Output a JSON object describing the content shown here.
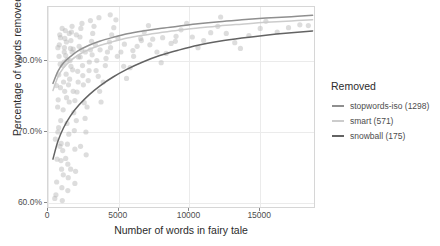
{
  "chart_data": {
    "type": "scatter",
    "title": "",
    "xlabel": "Number of words in fairy tale",
    "ylabel": "Percentage of words removed",
    "xlim": [
      0,
      18800
    ],
    "ylim": [
      0.595,
      0.875
    ],
    "xticks": [
      0,
      5000,
      10000,
      15000
    ],
    "xticklabels": [
      "0",
      "5000",
      "10000",
      "15000"
    ],
    "yticks": [
      0.6,
      0.7,
      0.8
    ],
    "yticklabels": [
      "60.0%",
      "70.0%",
      "80.0%"
    ],
    "grid": true,
    "legend_position": "right",
    "legend_title": "Removed",
    "point_color": "#b3b3b3",
    "point_alpha": 0.45,
    "point_radius": 2.6,
    "series": [
      {
        "name": "stopwords-iso (1298)",
        "label": "stopwords-iso",
        "count": 1298,
        "color": "#8f8f8f",
        "curve": [
          [
            350,
            0.768
          ],
          [
            700,
            0.785
          ],
          [
            1100,
            0.797
          ],
          [
            1600,
            0.806
          ],
          [
            2200,
            0.8145
          ],
          [
            2900,
            0.8215
          ],
          [
            3700,
            0.8275
          ],
          [
            4600,
            0.8325
          ],
          [
            5600,
            0.8375
          ],
          [
            6700,
            0.8415
          ],
          [
            7900,
            0.845
          ],
          [
            9200,
            0.848
          ],
          [
            10600,
            0.8515
          ],
          [
            12100,
            0.8545
          ],
          [
            13700,
            0.857
          ],
          [
            15400,
            0.8595
          ],
          [
            17200,
            0.8615
          ],
          [
            18700,
            0.8635
          ]
        ]
      },
      {
        "name": "smart (571)",
        "label": "smart",
        "count": 571,
        "color": "#cccccc",
        "curve": [
          [
            350,
            0.758
          ],
          [
            700,
            0.777
          ],
          [
            1100,
            0.79
          ],
          [
            1600,
            0.8
          ],
          [
            2200,
            0.8085
          ],
          [
            2900,
            0.8155
          ],
          [
            3700,
            0.8215
          ],
          [
            4600,
            0.8265
          ],
          [
            5600,
            0.8315
          ],
          [
            6700,
            0.8355
          ],
          [
            7900,
            0.839
          ],
          [
            9200,
            0.8425
          ],
          [
            10600,
            0.8455
          ],
          [
            12100,
            0.8485
          ],
          [
            13700,
            0.851
          ],
          [
            15400,
            0.8535
          ],
          [
            17200,
            0.8555
          ],
          [
            18700,
            0.857
          ]
        ]
      },
      {
        "name": "snowball (175)",
        "label": "snowball",
        "count": 175,
        "color": "#636363",
        "curve": [
          [
            350,
            0.662
          ],
          [
            700,
            0.687
          ],
          [
            1100,
            0.706
          ],
          [
            1600,
            0.723
          ],
          [
            2200,
            0.738
          ],
          [
            2900,
            0.752
          ],
          [
            3700,
            0.765
          ],
          [
            4600,
            0.777
          ],
          [
            5600,
            0.788
          ],
          [
            6700,
            0.798
          ],
          [
            7900,
            0.807
          ],
          [
            9200,
            0.8145
          ],
          [
            10600,
            0.8215
          ],
          [
            12100,
            0.827
          ],
          [
            13700,
            0.8315
          ],
          [
            15400,
            0.8355
          ],
          [
            17200,
            0.839
          ],
          [
            18700,
            0.8415
          ]
        ]
      }
    ],
    "points": [
      [
        520,
        0.69
      ],
      [
        480,
        0.607
      ],
      [
        560,
        0.612
      ],
      [
        610,
        0.63
      ],
      [
        640,
        0.662
      ],
      [
        700,
        0.7
      ],
      [
        720,
        0.745
      ],
      [
        760,
        0.78
      ],
      [
        780,
        0.806
      ],
      [
        800,
        0.822
      ],
      [
        830,
        0.836
      ],
      [
        860,
        0.795
      ],
      [
        880,
        0.762
      ],
      [
        900,
        0.716
      ],
      [
        930,
        0.684
      ],
      [
        960,
        0.648
      ],
      [
        980,
        0.622
      ],
      [
        1010,
        0.604
      ],
      [
        1040,
        0.674
      ],
      [
        1070,
        0.731
      ],
      [
        1100,
        0.77
      ],
      [
        1130,
        0.798
      ],
      [
        1160,
        0.818
      ],
      [
        1190,
        0.831
      ],
      [
        1220,
        0.842
      ],
      [
        1250,
        0.807
      ],
      [
        1280,
        0.781
      ],
      [
        1310,
        0.748
      ],
      [
        1340,
        0.712
      ],
      [
        1370,
        0.683
      ],
      [
        1400,
        0.655
      ],
      [
        1430,
        0.636
      ],
      [
        1470,
        0.697
      ],
      [
        1500,
        0.742
      ],
      [
        1530,
        0.774
      ],
      [
        1560,
        0.8
      ],
      [
        1590,
        0.817
      ],
      [
        1620,
        0.828
      ],
      [
        1660,
        0.84
      ],
      [
        1700,
        0.812
      ],
      [
        1740,
        0.787
      ],
      [
        1780,
        0.757
      ],
      [
        1820,
        0.727
      ],
      [
        1860,
        0.702
      ],
      [
        1900,
        0.676
      ],
      [
        1950,
        0.645
      ],
      [
        2000,
        0.716
      ],
      [
        2050,
        0.756
      ],
      [
        2100,
        0.785
      ],
      [
        2150,
        0.805
      ],
      [
        2200,
        0.82
      ],
      [
        2260,
        0.833
      ],
      [
        2320,
        0.845
      ],
      [
        2380,
        0.815
      ],
      [
        2440,
        0.793
      ],
      [
        2500,
        0.766
      ],
      [
        2560,
        0.741
      ],
      [
        2620,
        0.719
      ],
      [
        2680,
        0.7
      ],
      [
        2760,
        0.735
      ],
      [
        2840,
        0.772
      ],
      [
        2920,
        0.798
      ],
      [
        3000,
        0.815
      ],
      [
        3080,
        0.827
      ],
      [
        3160,
        0.838
      ],
      [
        3250,
        0.848
      ],
      [
        3350,
        0.822
      ],
      [
        3450,
        0.8
      ],
      [
        3550,
        0.778
      ],
      [
        3650,
        0.757
      ],
      [
        3750,
        0.742
      ],
      [
        3900,
        0.77
      ],
      [
        4050,
        0.793
      ],
      [
        4200,
        0.812
      ],
      [
        4350,
        0.826
      ],
      [
        4500,
        0.836
      ],
      [
        4650,
        0.846
      ],
      [
        4800,
        0.857
      ],
      [
        4950,
        0.831
      ],
      [
        5150,
        0.812
      ],
      [
        5350,
        0.792
      ],
      [
        5550,
        0.775
      ],
      [
        5800,
        0.79
      ],
      [
        6050,
        0.806
      ],
      [
        6300,
        0.82
      ],
      [
        6550,
        0.831
      ],
      [
        6800,
        0.84
      ],
      [
        7100,
        0.849
      ],
      [
        7400,
        0.83
      ],
      [
        7700,
        0.812
      ],
      [
        8000,
        0.797
      ],
      [
        8350,
        0.81
      ],
      [
        8700,
        0.824
      ],
      [
        9050,
        0.834
      ],
      [
        9400,
        0.843
      ],
      [
        9800,
        0.852
      ],
      [
        10200,
        0.833
      ],
      [
        10600,
        0.818
      ],
      [
        11000,
        0.828
      ],
      [
        11500,
        0.839
      ],
      [
        12000,
        0.848
      ],
      [
        12200,
        0.861
      ],
      [
        12600,
        0.838
      ],
      [
        13200,
        0.825
      ],
      [
        13600,
        0.817
      ],
      [
        14200,
        0.835
      ],
      [
        15000,
        0.845
      ],
      [
        15400,
        0.855
      ],
      [
        16200,
        0.84
      ],
      [
        17000,
        0.846
      ],
      [
        17800,
        0.85
      ],
      [
        18400,
        0.849
      ],
      [
        1050,
        0.793
      ],
      [
        1180,
        0.757
      ],
      [
        1350,
        0.801
      ],
      [
        1450,
        0.766
      ],
      [
        1620,
        0.792
      ],
      [
        1780,
        0.816
      ],
      [
        1900,
        0.744
      ],
      [
        2130,
        0.77
      ],
      [
        2280,
        0.805
      ],
      [
        2460,
        0.779
      ],
      [
        2640,
        0.812
      ],
      [
        2900,
        0.786
      ],
      [
        3120,
        0.808
      ],
      [
        3400,
        0.786
      ],
      [
        3680,
        0.815
      ],
      [
        4100,
        0.803
      ],
      [
        4420,
        0.818
      ],
      [
        4900,
        0.806
      ],
      [
        5400,
        0.823
      ],
      [
        6000,
        0.814
      ],
      [
        6600,
        0.828
      ],
      [
        7200,
        0.822
      ],
      [
        8100,
        0.832
      ],
      [
        9000,
        0.827
      ],
      [
        700,
        0.818
      ],
      [
        880,
        0.832
      ],
      [
        1000,
        0.845
      ],
      [
        1150,
        0.812
      ],
      [
        1300,
        0.826
      ],
      [
        1500,
        0.838
      ],
      [
        1700,
        0.848
      ],
      [
        2000,
        0.836
      ],
      [
        2400,
        0.852
      ],
      [
        3000,
        0.856
      ],
      [
        3600,
        0.86
      ],
      [
        4400,
        0.864
      ],
      [
        600,
        0.765
      ],
      [
        680,
        0.735
      ],
      [
        750,
        0.706
      ],
      [
        840,
        0.68
      ],
      [
        920,
        0.66
      ],
      [
        1080,
        0.64
      ],
      [
        1250,
        0.663
      ],
      [
        1600,
        0.648
      ],
      [
        1900,
        0.628
      ],
      [
        2300,
        0.68
      ],
      [
        2700,
        0.668
      ],
      [
        1400,
        0.618
      ]
    ]
  }
}
